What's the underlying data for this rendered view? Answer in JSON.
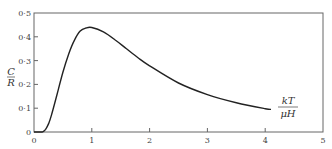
{
  "chart_data": {
    "type": "line",
    "title": "",
    "xlabel": "kT / μH",
    "ylabel": "C / R",
    "xlim": [
      0,
      5
    ],
    "ylim": [
      0,
      0.5
    ],
    "grid": false,
    "legend": null,
    "x_ticks": [
      "0",
      "1",
      "2",
      "3",
      "4",
      "5"
    ],
    "y_ticks": [
      "0",
      "0·1",
      "0·2",
      "0·3",
      "0·4",
      "0·5"
    ],
    "series": [
      {
        "name": "Schottky heat capacity",
        "x": [
          0.0,
          0.1,
          0.15,
          0.2,
          0.25,
          0.3,
          0.4,
          0.5,
          0.6,
          0.7,
          0.8,
          0.9,
          1.0,
          1.2,
          1.4,
          1.6,
          1.8,
          2.0,
          2.5,
          3.0,
          3.5,
          4.0,
          4.1
        ],
        "y": [
          0.0,
          0.0,
          0.001,
          0.011,
          0.034,
          0.069,
          0.159,
          0.251,
          0.328,
          0.386,
          0.424,
          0.437,
          0.439,
          0.421,
          0.388,
          0.35,
          0.312,
          0.278,
          0.206,
          0.157,
          0.123,
          0.098,
          0.095
        ]
      }
    ]
  },
  "labels": {
    "y_num": "C",
    "y_den": "R",
    "x_num": "kT",
    "x_den": "μH",
    "xt0": "0",
    "xt1": "1",
    "xt2": "2",
    "xt3": "3",
    "xt4": "4",
    "xt5": "5",
    "yt0": "0",
    "yt1": "0·1",
    "yt2": "0·2",
    "yt3": "0·3",
    "yt4": "0·4",
    "yt5": "0·5"
  }
}
